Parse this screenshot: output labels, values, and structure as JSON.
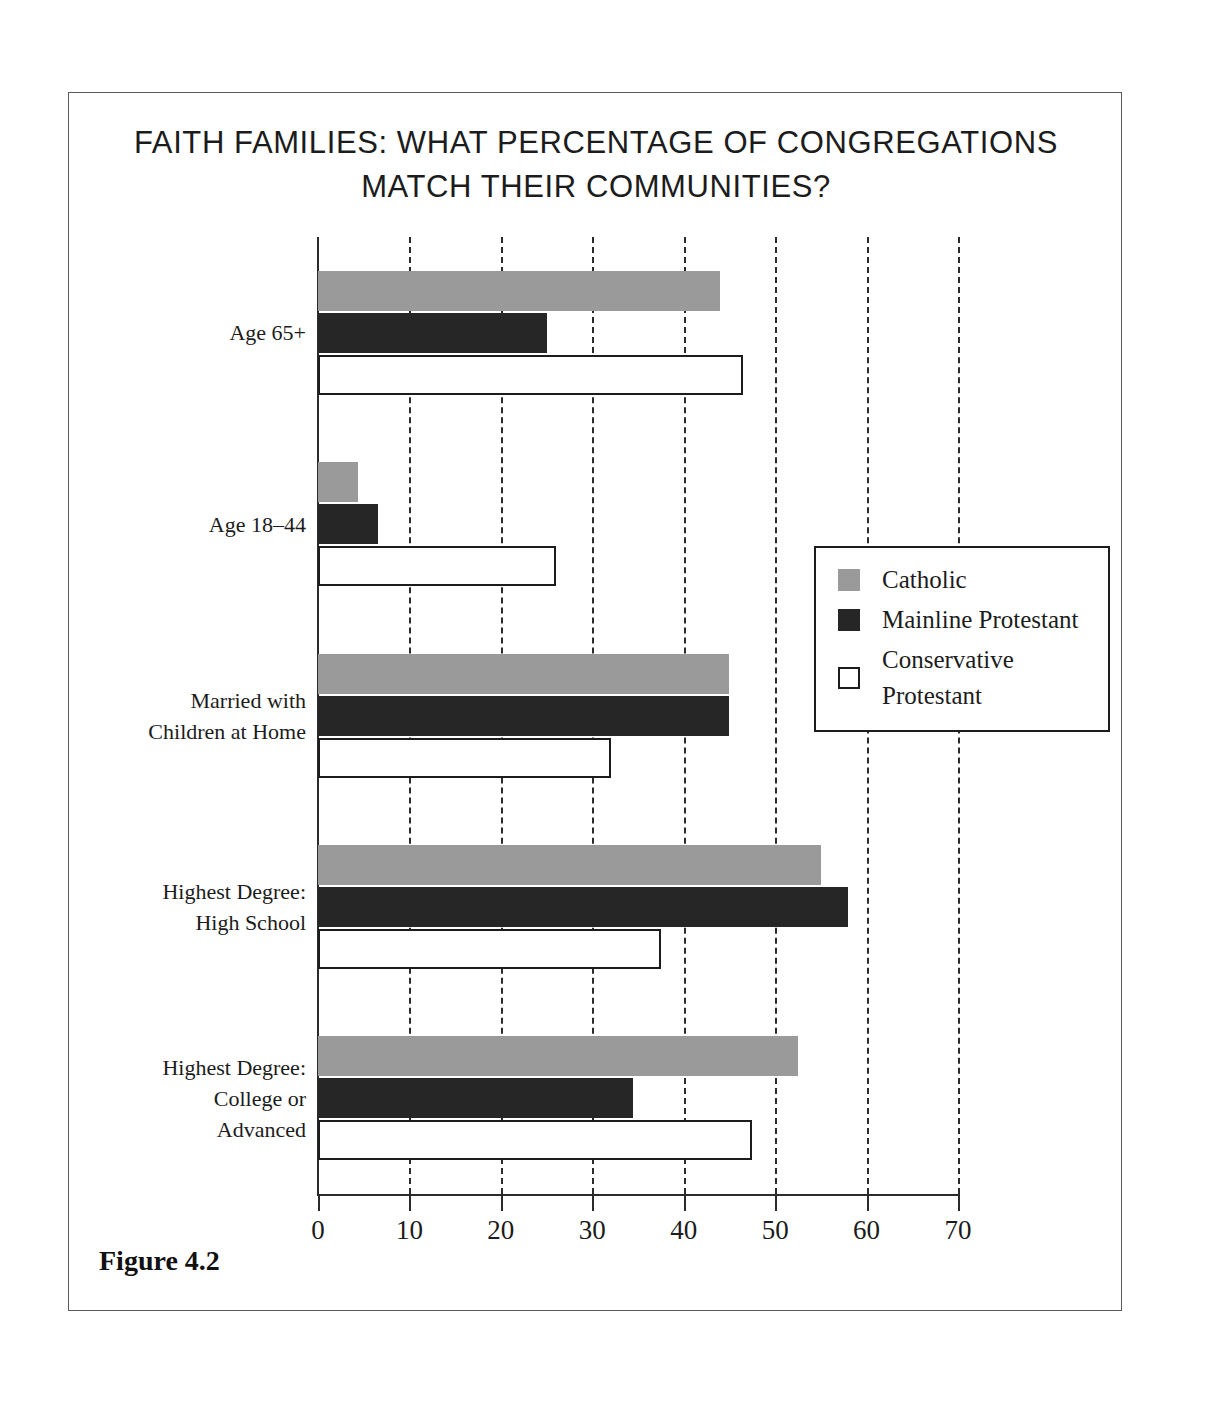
{
  "figure": {
    "title": "FAITH FAMILIES: WHAT PERCENTAGE OF CONGREGATIONS MATCH THEIR COMMUNITIES?",
    "caption": "Figure 4.2"
  },
  "legend": {
    "position": "middle-right",
    "items": [
      {
        "label": "Catholic",
        "swatch": "catholic",
        "color": "#9a9a9a"
      },
      {
        "label": "Mainline Protestant",
        "swatch": "mainline",
        "color": "#262626"
      },
      {
        "label": "Conservative Protestant",
        "swatch": "conservative",
        "color": "#ffffff"
      }
    ]
  },
  "axis": {
    "x_ticks": [
      "0",
      "10",
      "20",
      "30",
      "40",
      "50",
      "60",
      "70"
    ],
    "x_min": 0,
    "x_max": 70,
    "x_step": 10
  },
  "chart_data": {
    "type": "bar",
    "orientation": "horizontal",
    "title": "FAITH FAMILIES: WHAT PERCENTAGE OF CONGREGATIONS MATCH THEIR COMMUNITIES?",
    "xlabel": "",
    "ylabel": "",
    "xlim": [
      0,
      70
    ],
    "grid": "vertical-dashed",
    "legend_position": "middle-right",
    "categories": [
      "Age 65+",
      "Age 18–44",
      "Married with\nChildren at Home",
      "Highest Degree:\nHigh School",
      "Highest Degree:\nCollege or\nAdvanced"
    ],
    "series": [
      {
        "name": "Catholic",
        "color": "#9a9a9a",
        "values": [
          44,
          4.4,
          45,
          55,
          52.5
        ]
      },
      {
        "name": "Mainline Protestant",
        "color": "#262626",
        "values": [
          25,
          6.6,
          45,
          58,
          34.5
        ]
      },
      {
        "name": "Conservative Protestant",
        "color": "#ffffff",
        "values": [
          46.5,
          26,
          32,
          37.5,
          47.5
        ]
      }
    ]
  }
}
